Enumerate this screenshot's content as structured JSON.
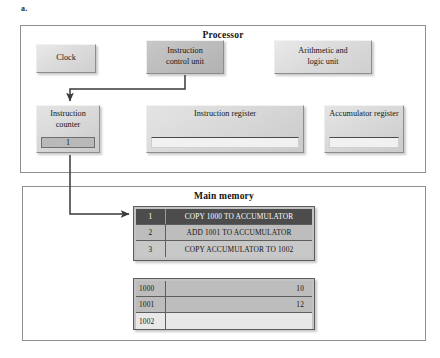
{
  "figure": {
    "label": "a."
  },
  "processor": {
    "title": "Processor",
    "components": [
      {
        "id": "clock",
        "lines": [
          "Clock"
        ],
        "style": "light"
      },
      {
        "id": "instruction-control-unit",
        "lines": [
          "Instruction",
          "control unit"
        ],
        "style": "shaded"
      },
      {
        "id": "arithmetic-logic-unit",
        "lines": [
          "Arithmetic and",
          "logic unit"
        ],
        "style": "light"
      }
    ],
    "registers": [
      {
        "id": "instruction-counter",
        "lines": [
          "Instruction",
          "counter"
        ],
        "value": "1",
        "filled": true
      },
      {
        "id": "instruction-register",
        "lines": [
          "Instruction",
          "register"
        ],
        "value": "",
        "filled": false
      },
      {
        "id": "accumulator-register",
        "lines": [
          "Accumulator",
          "register"
        ],
        "value": "",
        "filled": false
      }
    ]
  },
  "memory": {
    "title": "Main memory",
    "program": {
      "rows": [
        {
          "address": "1",
          "text": "COPY 1000 TO ACCUMULATOR",
          "highlighted": true
        },
        {
          "address": "2",
          "text": "ADD 1001 TO ACCUMULATOR",
          "highlighted": false
        },
        {
          "address": "3",
          "text": "COPY ACCUMULATOR TO 1002",
          "highlighted": false
        }
      ]
    },
    "data": {
      "rows": [
        {
          "address": "1000",
          "value": "10",
          "empty": false
        },
        {
          "address": "1001",
          "value": "12",
          "empty": false
        },
        {
          "address": "1002",
          "value": "",
          "empty": true
        }
      ]
    }
  },
  "connections": [
    {
      "id": "icu-to-instruction-counter",
      "from": "instruction-control-unit",
      "to": "instruction-counter"
    },
    {
      "id": "instruction-counter-to-memory-row-1",
      "from": "instruction-counter",
      "to": "program-row-1"
    }
  ],
  "colors": {
    "panel_border": "#8f8f92",
    "plate_light": "#dcdcdc",
    "plate_shaded": "#bdbdbd",
    "highlight_row_bg": "#4c4c4c",
    "highlight_row_text": "#ffffff",
    "wire": "#3a3a3a"
  }
}
